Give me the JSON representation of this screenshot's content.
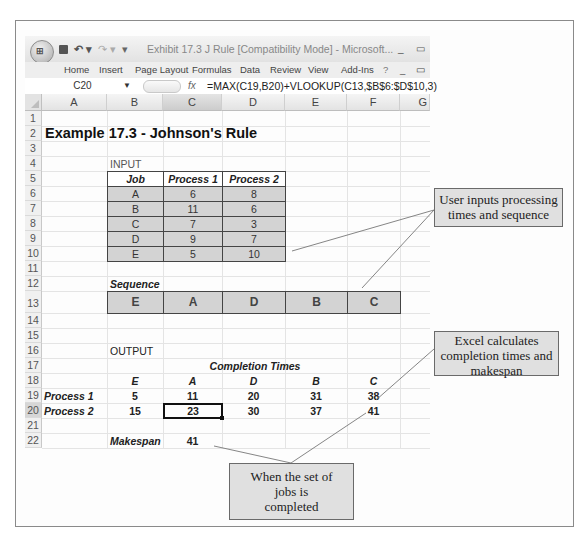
{
  "window": {
    "title": "Exhibit 17.3 J Rule  [Compatibility Mode] - Microsoft...",
    "office_button_glyph": "⊞",
    "minimize": "_",
    "restore": "▭"
  },
  "ribbon": {
    "tabs": [
      "Home",
      "Insert",
      "Page Layout",
      "Formulas",
      "Data",
      "Review",
      "View",
      "Add-Ins"
    ],
    "help_icon": "?"
  },
  "formula_bar": {
    "name_box": "C20",
    "fx_label": "fx",
    "formula": "=MAX(C19,B20)+VLOOKUP(C13,$B$6:$D$10,3)"
  },
  "columns": [
    "A",
    "B",
    "C",
    "D",
    "E",
    "F",
    "G"
  ],
  "rows": [
    "1",
    "2",
    "3",
    "4",
    "5",
    "6",
    "7",
    "8",
    "9",
    "10",
    "11",
    "12",
    "13",
    "14",
    "15",
    "16",
    "17",
    "18",
    "19",
    "20",
    "21",
    "22"
  ],
  "sheet": {
    "title": "Example 17.3 - Johnson's Rule",
    "input_label": "INPUT",
    "input_table": {
      "headers": [
        "Job",
        "Process 1",
        "Process 2"
      ],
      "rows": [
        [
          "A",
          "6",
          "8"
        ],
        [
          "B",
          "11",
          "6"
        ],
        [
          "C",
          "7",
          "3"
        ],
        [
          "D",
          "9",
          "7"
        ],
        [
          "E",
          "5",
          "10"
        ]
      ]
    },
    "sequence_label": "Sequence",
    "sequence": [
      "E",
      "A",
      "D",
      "B",
      "C"
    ],
    "output_label": "OUTPUT",
    "completion_times_label": "Completion Times",
    "output_headers": [
      "E",
      "A",
      "D",
      "B",
      "C"
    ],
    "process1_label": "Process 1",
    "process1_values": [
      "5",
      "11",
      "20",
      "31",
      "38"
    ],
    "process2_label": "Process 2",
    "process2_values": [
      "15",
      "23",
      "30",
      "37",
      "41"
    ],
    "makespan_label": "Makespan",
    "makespan_value": "41"
  },
  "callouts": {
    "user_inputs": "User inputs processing times and sequence",
    "excel_calculates": "Excel calculates completion times and makespan",
    "when_completed": "When the set of jobs is completed"
  }
}
